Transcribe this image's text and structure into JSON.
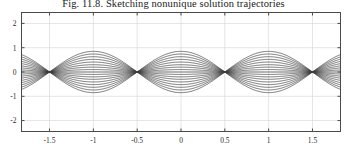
{
  "figure": {
    "caption": "Fig. 11.8.  Sketching nonunique solution trajectories",
    "background_color": "#ffffff",
    "axis_color": "#4a4a4a",
    "grid_color": "#d9d9d9",
    "curve_color": "#3c3c3c"
  },
  "chart_data": {
    "type": "line",
    "title": "Fig. 11.8.  Sketching nonunique solution trajectories",
    "xlabel": "",
    "ylabel": "",
    "xlim": [
      -1.82,
      1.82
    ],
    "ylim": [
      -2.45,
      2.45
    ],
    "xticks": [
      -1.5,
      -1,
      -0.5,
      0,
      0.5,
      1,
      1.5
    ],
    "xticklabels": [
      "-1.5",
      "-1",
      "-0.5",
      "0",
      "0.5",
      "1",
      "1.5"
    ],
    "yticks": [
      -2,
      -1,
      0,
      1,
      2
    ],
    "yticklabels": [
      "-2",
      "-1",
      "0",
      "1",
      "2"
    ],
    "grid": true,
    "legend": null,
    "nodes_x": [
      -1.5,
      -0.5,
      0.5,
      1.5
    ],
    "amplitudes": [
      0.85,
      0.74,
      0.63,
      0.52,
      0.41,
      0.3,
      0.2,
      0.1,
      0,
      -0.1,
      -0.2,
      -0.3,
      -0.41,
      -0.52,
      -0.63,
      -0.74,
      -0.85
    ],
    "curve_form": "y = A * cos(pi * x)",
    "series": [
      {
        "name": "A = 0.85",
        "amplitude": 0.85
      },
      {
        "name": "A = 0.74",
        "amplitude": 0.74
      },
      {
        "name": "A = 0.63",
        "amplitude": 0.63
      },
      {
        "name": "A = 0.52",
        "amplitude": 0.52
      },
      {
        "name": "A = 0.41",
        "amplitude": 0.41
      },
      {
        "name": "A = 0.30",
        "amplitude": 0.3
      },
      {
        "name": "A = 0.20",
        "amplitude": 0.2
      },
      {
        "name": "A = 0.10",
        "amplitude": 0.1
      },
      {
        "name": "A = 0.00",
        "amplitude": 0
      },
      {
        "name": "A = -0.10",
        "amplitude": -0.1
      },
      {
        "name": "A = -0.20",
        "amplitude": -0.2
      },
      {
        "name": "A = -0.30",
        "amplitude": -0.3
      },
      {
        "name": "A = -0.41",
        "amplitude": -0.41
      },
      {
        "name": "A = -0.52",
        "amplitude": -0.52
      },
      {
        "name": "A = -0.63",
        "amplitude": -0.63
      },
      {
        "name": "A = -0.74",
        "amplitude": -0.74
      },
      {
        "name": "A = -0.85",
        "amplitude": -0.85
      }
    ]
  }
}
